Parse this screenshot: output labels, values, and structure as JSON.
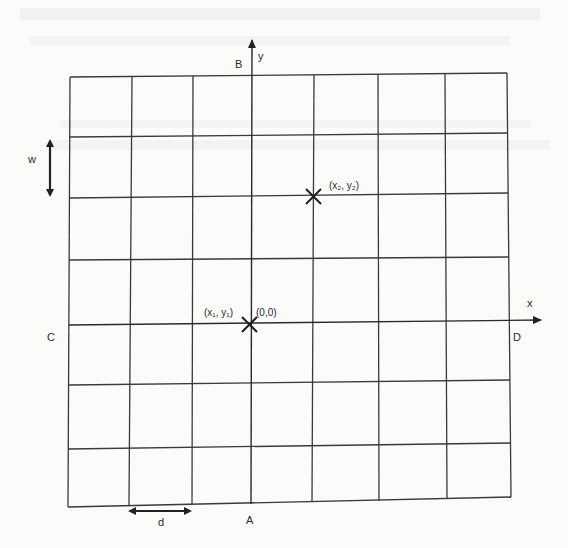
{
  "diagram": {
    "grid": {
      "columns": 7,
      "rows": 7,
      "vertical_lines_top_x": [
        70,
        132,
        193,
        252,
        314,
        378,
        445,
        507
      ],
      "vertical_lines_bottom_x": [
        68,
        129,
        192,
        251,
        312,
        379,
        447,
        511
      ],
      "horizontal_lines_left_y": [
        77,
        137,
        198,
        260,
        325,
        385,
        449,
        507
      ],
      "horizontal_lines_right_y": [
        73,
        133,
        193,
        257,
        320,
        380,
        443,
        497
      ]
    },
    "axes": {
      "y_axis_label": "y",
      "x_axis_label": "x",
      "top_label": "B",
      "bottom_label": "A",
      "left_label": "C",
      "right_label": "D"
    },
    "points": [
      {
        "label": "(x₁, y₁)",
        "secondary_label": "(0,0)",
        "marker": "cross"
      },
      {
        "label": "(x₂, y₂)",
        "marker": "cross"
      }
    ],
    "dimensions": {
      "width_label": "w",
      "spacing_label": "d"
    },
    "colors": {
      "line": "#3a3a3a",
      "background": "#fbfbf9"
    }
  }
}
